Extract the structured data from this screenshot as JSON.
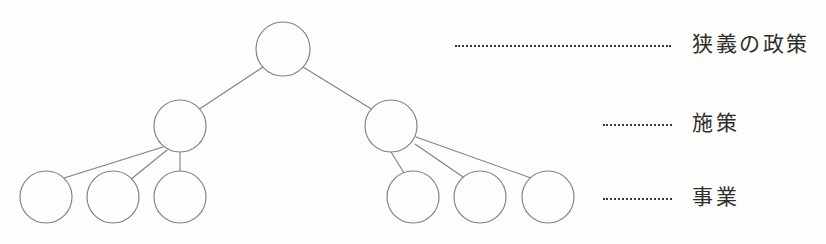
{
  "diagram": {
    "title": "",
    "type": "hierarchy-tree",
    "stroke_color": "#81807a",
    "background_color": "#fdfdfb",
    "label_color": "#2e2e2a",
    "levels": [
      {
        "id": "level-1",
        "label": "狭義の政策",
        "node_count": 1
      },
      {
        "id": "level-2",
        "label": "施策",
        "node_count": 2
      },
      {
        "id": "level-3",
        "label": "事業",
        "node_count": 6
      }
    ],
    "nodes": [
      {
        "id": "root",
        "level": 1,
        "label": "",
        "cx": 283,
        "cy": 49,
        "r": 27
      },
      {
        "id": "mid-l",
        "level": 2,
        "label": "",
        "cx": 180,
        "cy": 126,
        "r": 26
      },
      {
        "id": "mid-r",
        "level": 2,
        "label": "",
        "cx": 391,
        "cy": 126,
        "r": 26
      },
      {
        "id": "leaf-1",
        "level": 3,
        "label": "",
        "cx": 46,
        "cy": 197,
        "r": 26
      },
      {
        "id": "leaf-2",
        "level": 3,
        "label": "",
        "cx": 113,
        "cy": 197,
        "r": 26
      },
      {
        "id": "leaf-3",
        "level": 3,
        "label": "",
        "cx": 180,
        "cy": 197,
        "r": 26
      },
      {
        "id": "leaf-4",
        "level": 3,
        "label": "",
        "cx": 413,
        "cy": 197,
        "r": 26
      },
      {
        "id": "leaf-5",
        "level": 3,
        "label": "",
        "cx": 480,
        "cy": 197,
        "r": 26
      },
      {
        "id": "leaf-6",
        "level": 3,
        "label": "",
        "cx": 548,
        "cy": 197,
        "r": 26
      }
    ],
    "edges": [
      {
        "from": "root",
        "to": "mid-l"
      },
      {
        "from": "root",
        "to": "mid-r"
      },
      {
        "from": "mid-l",
        "to": "leaf-1"
      },
      {
        "from": "mid-l",
        "to": "leaf-2"
      },
      {
        "from": "mid-l",
        "to": "leaf-3"
      },
      {
        "from": "mid-r",
        "to": "leaf-4"
      },
      {
        "from": "mid-r",
        "to": "leaf-5"
      },
      {
        "from": "mid-r",
        "to": "leaf-6"
      }
    ],
    "leaders": [
      {
        "id": "leader-1",
        "x": 455,
        "y": 45,
        "width": 216
      },
      {
        "id": "leader-2",
        "x": 603,
        "y": 124,
        "width": 69
      },
      {
        "id": "leader-3",
        "x": 603,
        "y": 198,
        "width": 69
      }
    ],
    "label_positions": [
      {
        "id": "label-1",
        "x": 692,
        "y": 34
      },
      {
        "id": "label-2",
        "x": 692,
        "y": 113
      },
      {
        "id": "label-3",
        "x": 692,
        "y": 187
      }
    ]
  }
}
